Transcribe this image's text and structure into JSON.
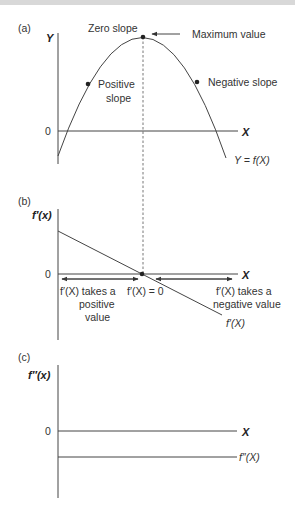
{
  "figure": {
    "panels": [
      {
        "id": "a",
        "panel_label": "(a)",
        "y_axis_label": "Y",
        "x_axis_label": "X",
        "origin_label": "0",
        "curve_label": "Y = f(X)",
        "annotations": {
          "zero_slope": "Zero slope",
          "maximum_value": "Maximum value",
          "positive_slope_line1": "Positive",
          "positive_slope_line2": "slope",
          "negative_slope": "Negative slope"
        }
      },
      {
        "id": "b",
        "panel_label": "(b)",
        "y_axis_label": "f′(x)",
        "x_axis_label": "X",
        "origin_label": "0",
        "curve_label": "f′(X)",
        "annotations": {
          "left_line1": "f′(X) takes a",
          "left_line2": "positive",
          "left_line3": "value",
          "center": "f′(X) = 0",
          "right_line1": "f′(X) takes a",
          "right_line2": "negative value"
        }
      },
      {
        "id": "c",
        "panel_label": "(c)",
        "y_axis_label": "f″(x)",
        "x_axis_label": "X",
        "origin_label": "0",
        "curve_label": "f″(X)"
      }
    ]
  }
}
